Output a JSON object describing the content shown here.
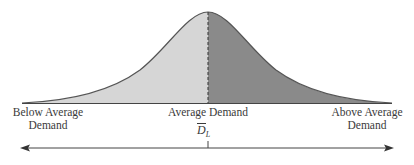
{
  "diagram": {
    "type": "normal-distribution",
    "labels": {
      "left": [
        "Below Average",
        "Demand"
      ],
      "center": "Average Demand",
      "right": [
        "Above Average",
        "Demand"
      ],
      "mean_symbol": "D",
      "mean_subscript": "L"
    },
    "colors": {
      "left_fill": "#d6d6d6",
      "right_fill": "#8a8a8a",
      "curve": "#555555",
      "axis": "#444444"
    }
  }
}
